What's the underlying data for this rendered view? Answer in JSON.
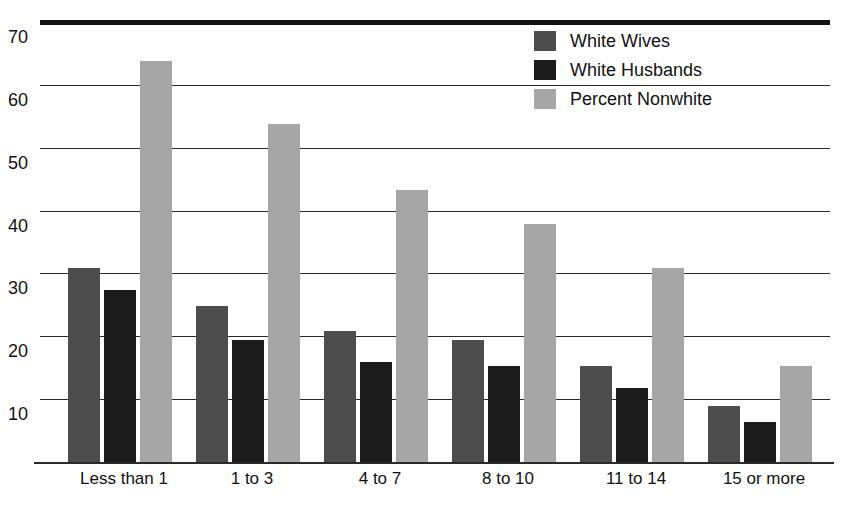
{
  "chart_data": {
    "type": "bar",
    "title": "",
    "subtitle": "",
    "xlabel": "",
    "ylabel": "",
    "ylim": [
      0,
      70
    ],
    "yticks": [
      70,
      60,
      50,
      40,
      30,
      20,
      10
    ],
    "grid": true,
    "legend_position": "top-right",
    "categories": [
      "Less than 1",
      "1 to 3",
      "4 to 7",
      "8 to 10",
      "11 to 14",
      "15 or more"
    ],
    "series": [
      {
        "name": "White Wives",
        "color": "#4d4d4d",
        "values": [
          31,
          25,
          21,
          19.5,
          15.5,
          9
        ]
      },
      {
        "name": "White Husbands",
        "color": "#1a1a1a",
        "values": [
          27.5,
          19.5,
          16,
          15.5,
          12,
          6.5
        ]
      },
      {
        "name": "Percent Nonwhite",
        "color": "#a6a6a6",
        "values": [
          64,
          54,
          43.5,
          38,
          31,
          15.5
        ]
      }
    ]
  },
  "axis": {
    "y_tick_labels": [
      "70",
      "60",
      "50",
      "40",
      "30",
      "20",
      "10"
    ],
    "x_tick_labels": [
      "Less than 1",
      "1 to 3",
      "4 to 7",
      "8 to 10",
      "11 to 14",
      "15 or more"
    ]
  },
  "legend": {
    "items": [
      {
        "label": "White Wives",
        "color": "#4d4d4d",
        "swatch_name": "legend-swatch-white-wives"
      },
      {
        "label": "White Husbands",
        "color": "#1a1a1a",
        "swatch_name": "legend-swatch-white-husbands"
      },
      {
        "label": "Percent Nonwhite",
        "color": "#a6a6a6",
        "swatch_name": "legend-swatch-percent-nonwhite"
      }
    ]
  },
  "colors": {
    "white_wives": "#4d4d4d",
    "white_husbands": "#1a1a1a",
    "percent_nonwhite": "#a6a6a6",
    "axis": "#2b2b2b",
    "top_rule": "#111111",
    "background": "#ffffff"
  }
}
